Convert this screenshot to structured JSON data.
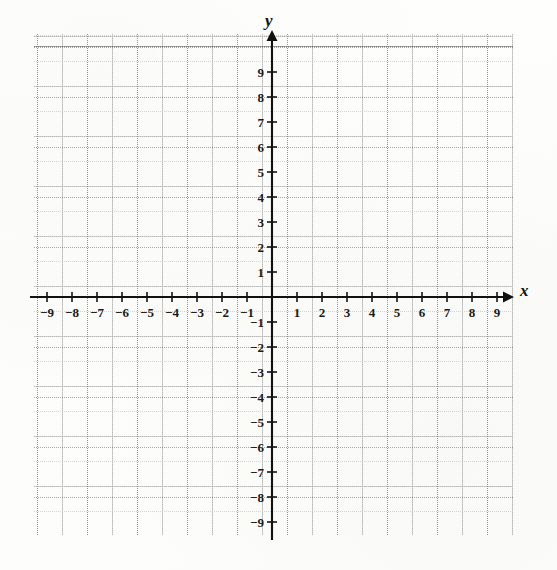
{
  "figure": {
    "kind": "blank-cartesian-coordinate-plane",
    "axis_labels": {
      "x": "x",
      "y": "y"
    },
    "origin_label": ""
  },
  "chart_data": {
    "type": "scatter",
    "title": "",
    "xlabel": "x",
    "ylabel": "y",
    "xlim": [
      -9.6,
      9.6
    ],
    "ylim": [
      -10.5,
      9.5
    ],
    "grid": true,
    "grid_minor_step": 0.5,
    "grid_major_step": 1,
    "legend": "none",
    "series": [],
    "x_ticks": [
      -9,
      -8,
      -7,
      -6,
      -5,
      -4,
      -3,
      -2,
      -1,
      1,
      2,
      3,
      4,
      5,
      6,
      7,
      8,
      9
    ],
    "y_ticks": [
      9,
      8,
      7,
      6,
      5,
      4,
      3,
      2,
      1,
      -1,
      -2,
      -3,
      -4,
      -5,
      -6,
      -7,
      -8,
      -9
    ],
    "x_tick_labels": [
      "−9",
      "−8",
      "−7",
      "−6",
      "−5",
      "−4",
      "−3",
      "−2",
      "−1",
      "1",
      "2",
      "3",
      "4",
      "5",
      "6",
      "7",
      "8",
      "9"
    ],
    "y_tick_labels": [
      "9",
      "8",
      "7",
      "6",
      "5",
      "4",
      "3",
      "2",
      "1",
      "−1",
      "−2",
      "−3",
      "−4",
      "−5",
      "−6",
      "−7",
      "−8",
      "−9"
    ],
    "colors": {
      "axis": "#111111",
      "grid_minor": "#9a9a9a",
      "grid_major": "#5e5e5e",
      "label": "#1a1a1a",
      "background": "#fdfdfc"
    }
  }
}
